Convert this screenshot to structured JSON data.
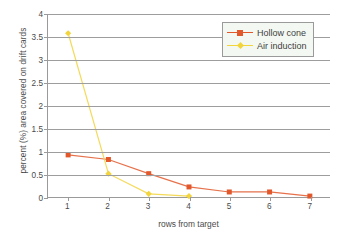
{
  "chart_data": {
    "type": "line",
    "title": "",
    "xlabel": "rows from target",
    "ylabel": "percent (%) area covered on drift cards",
    "categories": [
      "1",
      "2",
      "3",
      "4",
      "5",
      "6",
      "7"
    ],
    "ylim": [
      0,
      4
    ],
    "ytick_step": 0.5,
    "yticks": [
      "0",
      "0.5",
      "1",
      "1.5",
      "2",
      "2.5",
      "3",
      "3.5",
      "4"
    ],
    "grid": "horizontal",
    "legend_position": "top-right",
    "series": [
      {
        "name": "Hollow cone",
        "color": "#E2582B",
        "marker": "square",
        "values": [
          0.92,
          0.82,
          0.51,
          0.22,
          0.11,
          0.11,
          0.02
        ]
      },
      {
        "name": "Air induction",
        "color": "#F2D43C",
        "marker": "diamond",
        "values": [
          3.58,
          0.51,
          0.07,
          0.02,
          null,
          null,
          null
        ]
      }
    ]
  },
  "legend": {
    "items": [
      {
        "label": "Hollow cone"
      },
      {
        "label": "Air induction"
      }
    ]
  },
  "axes": {
    "x_title": "rows from target",
    "y_title": "percent (%) area covered on drift cards"
  },
  "colors": {
    "hollow_cone": "#E2582B",
    "air_induction": "#F2D43C",
    "axis": "#9a9a9a",
    "grid": "#9d9d9d",
    "text": "#4a4a4a",
    "legend_background": "#f4f8f2"
  }
}
